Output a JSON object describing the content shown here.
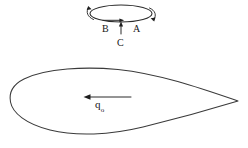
{
  "figure": {
    "background_color": "#ffffff",
    "line_color": "#2b2b2b",
    "text_color": "#151515",
    "width": 248,
    "height": 148
  },
  "labels": {
    "point_a": "A",
    "point_b": "B",
    "point_c": "C",
    "velocity_symbol": "q",
    "velocity_subscript": "o"
  },
  "vortex_ring": {
    "name": "vortex-ring-ellipse",
    "center_x": 121,
    "center_y": 13.5,
    "radius_x": 31,
    "radius_y": 8.5,
    "rotation_arrow_left": "counterclockwise-curved-arrow",
    "rotation_arrow_right": "counterclockwise-curved-arrow",
    "interior_arrow_direction": "right",
    "vertical_arrow_direction": "up"
  },
  "body": {
    "name": "teardrop-airfoil-outline",
    "leading_edge_x": 10,
    "trailing_edge_x": 238,
    "trailing_edge_y": 101,
    "max_thickness_top_y": 69,
    "max_thickness_bottom_y": 134,
    "shape": "teardrop"
  },
  "freestream": {
    "name": "freestream-velocity-arrow",
    "direction": "left",
    "start_x": 131,
    "end_x": 84,
    "y": 97
  }
}
